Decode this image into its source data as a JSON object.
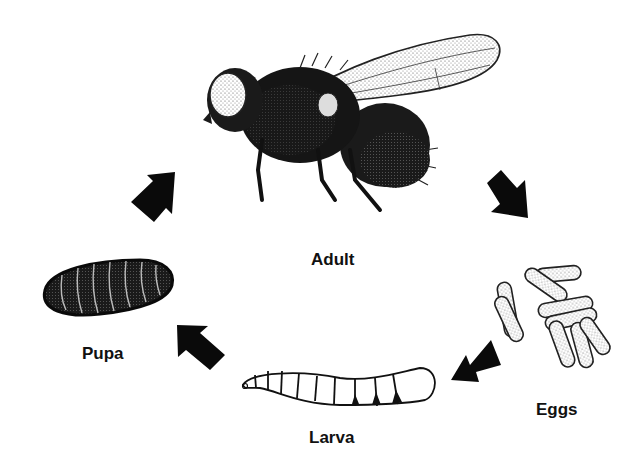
{
  "diagram": {
    "type": "life-cycle",
    "stages": [
      {
        "id": "adult",
        "label": "Adult"
      },
      {
        "id": "eggs",
        "label": "Eggs"
      },
      {
        "id": "larva",
        "label": "Larva"
      },
      {
        "id": "pupa",
        "label": "Pupa"
      }
    ],
    "arrows": [
      {
        "from": "adult",
        "to": "eggs"
      },
      {
        "from": "eggs",
        "to": "larva"
      },
      {
        "from": "larva",
        "to": "pupa"
      },
      {
        "from": "pupa",
        "to": "adult"
      }
    ],
    "colors": {
      "ink": "#111111",
      "background": "#ffffff",
      "wing": "#eeeeee"
    }
  }
}
